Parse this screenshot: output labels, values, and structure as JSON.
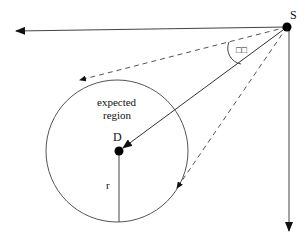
{
  "diagram": {
    "title": "",
    "labels": {
      "source": "S",
      "destination": "D",
      "region_line1": "expected",
      "region_line2": "region",
      "radius": "r",
      "angle": "□□"
    },
    "colors": {
      "stroke": "#222222",
      "background": "#ffffff"
    },
    "nodes": {
      "S": {
        "x": 287,
        "y": 27
      },
      "D": {
        "x": 119,
        "y": 151
      }
    },
    "circle": {
      "cx": 117,
      "cy": 151,
      "r": 71
    }
  }
}
